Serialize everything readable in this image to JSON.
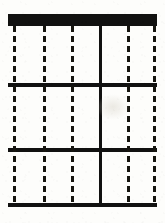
{
  "document": {
    "kind": "scanned-grid-form",
    "title": "Scanned grid sheet",
    "description": "Black and white scan of a ruled sheet: a heavy solid header bar across the top, three horizontal rule bars dividing the sheet into three equal row bands, one solid vertical rule down the centre, and five dashed vertical rules forming six cells.",
    "page_width": 165,
    "page_height": 223
  },
  "palette": {
    "background": "#fdfdfb",
    "ink": "#111110",
    "ink_dashed": "#16150f",
    "blotch": "#dcd8ce"
  },
  "sheet": {
    "left": 8,
    "top": 14,
    "right": 157,
    "bottom": 207,
    "width": 149,
    "height": 193
  },
  "header_bar": {
    "label": "header bar",
    "x": 8,
    "y": 14,
    "width": 149,
    "height": 12,
    "style": "solid-filled"
  },
  "horizontal_rules": [
    {
      "label": "rule-1",
      "y": 83,
      "x": 8,
      "width": 149,
      "height": 4,
      "style": "solid"
    },
    {
      "label": "rule-2",
      "y": 148,
      "x": 8,
      "width": 149,
      "height": 4,
      "style": "solid"
    },
    {
      "label": "rule-3",
      "y": 203,
      "x": 8,
      "width": 149,
      "height": 4,
      "style": "solid"
    }
  ],
  "vertical_rules": [
    {
      "label": "v-left-edge",
      "x": 13,
      "style": "dashed"
    },
    {
      "label": "v-col-1",
      "x": 43,
      "style": "dashed"
    },
    {
      "label": "v-col-2",
      "x": 71,
      "style": "dashed"
    },
    {
      "label": "v-centre",
      "x": 99,
      "style": "solid"
    },
    {
      "label": "v-col-4",
      "x": 127,
      "style": "dashed"
    },
    {
      "label": "v-right-edge",
      "x": 153,
      "style": "dashed"
    }
  ],
  "dash_pattern": {
    "dash_length": 6,
    "gap_length": 4,
    "period": 10,
    "stroke_width": 3
  },
  "bands": [
    {
      "label": "band-top",
      "top": 26,
      "bottom": 83,
      "height": 57
    },
    {
      "label": "band-middle",
      "top": 87,
      "bottom": 148,
      "height": 61
    },
    {
      "label": "band-bottom",
      "top": 152,
      "bottom": 203,
      "height": 51
    }
  ],
  "cells": [
    {
      "label": "cell-r1-c1",
      "row": 1,
      "col": 1
    },
    {
      "label": "cell-r1-c2",
      "row": 1,
      "col": 2
    },
    {
      "label": "cell-r2-c1",
      "row": 2,
      "col": 1
    },
    {
      "label": "cell-r2-c2",
      "row": 2,
      "col": 2
    },
    {
      "label": "cell-r3-c1",
      "row": 3,
      "col": 1
    },
    {
      "label": "cell-r3-c2",
      "row": 3,
      "col": 2
    }
  ],
  "counts": {
    "rows": 3,
    "columns": 2,
    "cells": 6,
    "dashed_vertical_rules": 5,
    "solid_vertical_rules": 1,
    "horizontal_rules": 3
  }
}
